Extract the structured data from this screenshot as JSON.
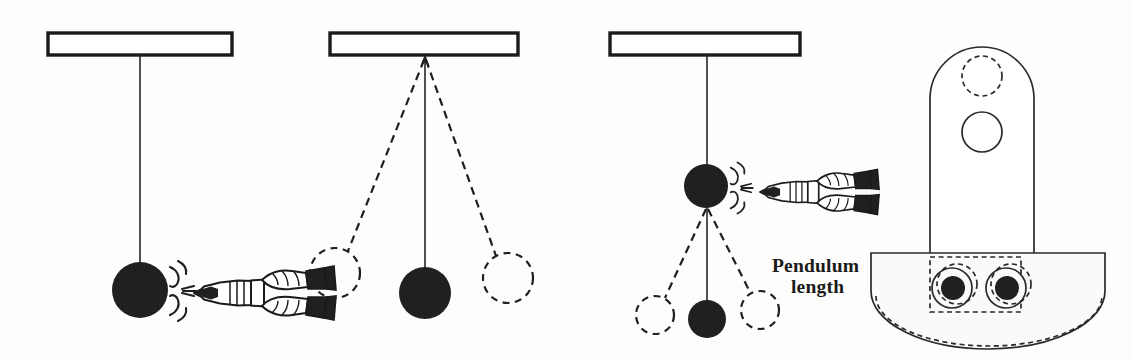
{
  "figure": {
    "width": 1133,
    "height": 361,
    "background_color": "#fdfdfb",
    "ink_color": "#1b1b1b",
    "style": "scanned black-and-white line drawing"
  },
  "labels": {
    "pendulum_length_line1": "Pendulum",
    "pendulum_length_line2": "length"
  },
  "panels": [
    {
      "id": "panel-1",
      "name": "simple-pendulum-at-rest-being-struck",
      "support_bar": {
        "x": 48,
        "y": 33,
        "width": 184,
        "height": 22
      },
      "pivot": {
        "x": 140,
        "y": 55
      },
      "rod": {
        "x1": 140,
        "y1": 55,
        "x2": 140,
        "y2": 262
      },
      "bob": {
        "cx": 140,
        "cy": 290,
        "r": 28,
        "fill": "solid"
      },
      "striker": {
        "cx": 215,
        "cy": 293,
        "type": "two-hands-holding-mallet"
      },
      "impact_marks": true
    },
    {
      "id": "panel-2",
      "name": "pendulum-swinging-between-extremes",
      "support_bar": {
        "x": 330,
        "y": 33,
        "width": 188,
        "height": 22
      },
      "pivot": {
        "x": 425,
        "y": 57
      },
      "rod": {
        "x1": 425,
        "y1": 57,
        "x2": 425,
        "y2": 268
      },
      "bob": {
        "cx": 425,
        "cy": 293,
        "r": 26,
        "fill": "solid"
      },
      "ghost_bobs": [
        {
          "cx": 335,
          "cy": 273,
          "r": 25,
          "fill": "dashed"
        },
        {
          "cx": 508,
          "cy": 278,
          "r": 25,
          "fill": "dashed"
        }
      ],
      "swing_arms": [
        {
          "x1": 425,
          "y1": 57,
          "x2": 347,
          "y2": 252,
          "style": "dashed"
        },
        {
          "x1": 425,
          "y1": 57,
          "x2": 497,
          "y2": 257,
          "style": "dashed"
        }
      ],
      "arrow_at_pivot": true
    },
    {
      "id": "panel-3",
      "name": "compound-pendulum-struck-at-midpoint",
      "support_bar": {
        "x": 610,
        "y": 33,
        "width": 190,
        "height": 22
      },
      "pivot": {
        "x": 707,
        "y": 55
      },
      "rod_upper": {
        "x1": 707,
        "y1": 55,
        "x2": 707,
        "y2": 164
      },
      "bob_upper": {
        "cx": 706,
        "cy": 186,
        "r": 22,
        "fill": "solid"
      },
      "rod_lower": {
        "x1": 707,
        "y1": 208,
        "x2": 707,
        "y2": 300
      },
      "bob_lower": {
        "cx": 707,
        "cy": 319,
        "r": 19,
        "fill": "solid"
      },
      "ghost_bobs": [
        {
          "cx": 655,
          "cy": 315,
          "r": 19,
          "fill": "dashed"
        },
        {
          "cx": 760,
          "cy": 310,
          "r": 19,
          "fill": "dashed"
        }
      ],
      "swing_arms": [
        {
          "x1": 707,
          "y1": 208,
          "x2": 664,
          "y2": 299,
          "style": "dashed"
        },
        {
          "x1": 707,
          "y1": 208,
          "x2": 752,
          "y2": 295,
          "style": "dashed"
        }
      ],
      "striker": {
        "cx": 790,
        "cy": 190,
        "type": "two-hands-holding-mallet"
      },
      "impact_marks": true,
      "length_label": {
        "x": 772,
        "y": 272
      }
    },
    {
      "id": "panel-4",
      "name": "physical-pendulum-arm-with-bob",
      "arm": {
        "x_left": 930,
        "x_right": 1034,
        "y_top": 47,
        "y_bottom": 268,
        "top_radius": 52
      },
      "holes": [
        {
          "cx": 982,
          "cy": 76,
          "r": 20,
          "style": "dashed",
          "name": "upper-pivot-hole-ghost"
        },
        {
          "cx": 982,
          "cy": 132,
          "r": 20,
          "style": "solid",
          "name": "pivot-hole"
        }
      ],
      "bob": {
        "x_left": 871,
        "x_right": 1105,
        "y_top": 253,
        "y_bottom": 340,
        "shape": "fan-semicircular-weight"
      },
      "bolts": [
        {
          "cx": 952,
          "cy": 288,
          "r_outer": 20,
          "r_inner": 12
        },
        {
          "cx": 1006,
          "cy": 288,
          "r_outer": 20,
          "r_inner": 12
        }
      ],
      "ghost_outline": {
        "x": 930,
        "y": 257,
        "width": 90,
        "height": 60,
        "style": "dashed"
      }
    }
  ]
}
